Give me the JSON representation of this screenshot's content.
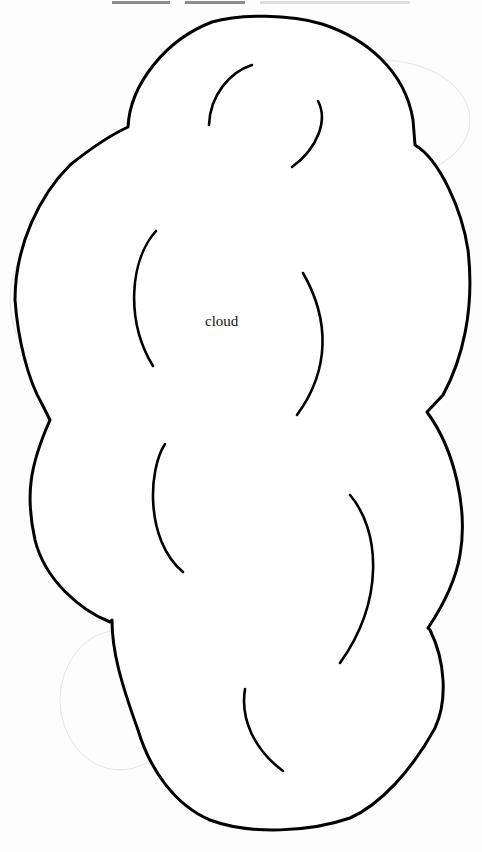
{
  "page": {
    "header_clipped": "",
    "background": "#fdfdfd"
  },
  "figure": {
    "label": "cloud",
    "stroke_color": "#000000",
    "shape": "cloud-outline"
  }
}
